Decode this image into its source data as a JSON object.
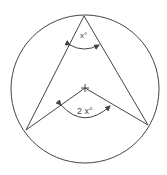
{
  "diagram": {
    "labels": {
      "inscribed_angle": "x°",
      "central_angle": "2 x°"
    },
    "colors": {
      "stroke": "#444444",
      "background": "#ffffff"
    },
    "geometry": {
      "circle": {
        "cx": 85,
        "cy": 89,
        "r": 74
      },
      "apex": [
        84,
        16
      ],
      "center": [
        85,
        88
      ],
      "left_point": [
        26,
        130
      ],
      "right_point": [
        148,
        125
      ]
    }
  }
}
